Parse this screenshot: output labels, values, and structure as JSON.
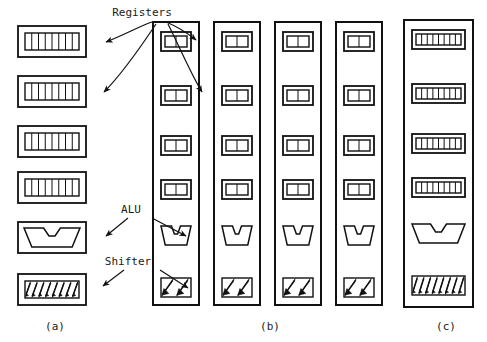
{
  "figure": {
    "title_labels": {
      "registers": "Registers",
      "alu": "ALU",
      "shifter": "Shifter"
    },
    "captions": [
      {
        "key": "a",
        "text": "(a)",
        "x": 55,
        "y": 330
      },
      {
        "key": "b",
        "text": "(b)",
        "x": 270,
        "y": 330
      },
      {
        "key": "c",
        "text": "(c)",
        "x": 446,
        "y": 330
      }
    ],
    "colors": {
      "stroke": "#111111",
      "background": "#ffffff",
      "fill": "#ffffff"
    },
    "label_positions": {
      "registers": {
        "x": 142,
        "y": 16
      },
      "alu": {
        "x": 131,
        "y": 213
      },
      "shifter": {
        "x": 128,
        "y": 265
      }
    },
    "panel_a": {
      "name": "discrete-components",
      "box_width": 68,
      "box_height": 31,
      "x": 18,
      "units": [
        {
          "type": "register",
          "y": 26,
          "cells": 8
        },
        {
          "type": "register",
          "y": 76,
          "cells": 8
        },
        {
          "type": "register",
          "y": 126,
          "cells": 8
        },
        {
          "type": "register",
          "y": 172,
          "cells": 8
        },
        {
          "type": "alu",
          "y": 222
        },
        {
          "type": "shifter",
          "y": 274,
          "arrows": 8
        }
      ]
    },
    "panel_b": {
      "name": "four-two-bit-slices",
      "slice_count": 4,
      "slice_width": 46,
      "slice_top": 22,
      "slice_height": 283,
      "slice_x": [
        153,
        214,
        275,
        336
      ],
      "inner_width": 30,
      "inner_height": 19,
      "units": [
        {
          "type": "register",
          "y": 32,
          "cells": 2
        },
        {
          "type": "register",
          "y": 86,
          "cells": 2
        },
        {
          "type": "register",
          "y": 136,
          "cells": 2
        },
        {
          "type": "register",
          "y": 180,
          "cells": 2
        },
        {
          "type": "alu",
          "y": 226
        },
        {
          "type": "shifter",
          "y": 278,
          "arrows": 2
        }
      ]
    },
    "panel_c": {
      "name": "one-eight-bit-slice",
      "slice_x": 404,
      "slice_top": 20,
      "slice_width": 69,
      "slice_height": 287,
      "inner_width": 53,
      "inner_height": 19,
      "units": [
        {
          "type": "register",
          "y": 30,
          "cells": 8
        },
        {
          "type": "register",
          "y": 84,
          "cells": 8
        },
        {
          "type": "register",
          "y": 134,
          "cells": 8
        },
        {
          "type": "register",
          "y": 178,
          "cells": 8
        },
        {
          "type": "alu",
          "y": 224
        },
        {
          "type": "shifter",
          "y": 276,
          "arrows": 8
        }
      ]
    },
    "arrows": {
      "registers": [
        {
          "name": "registers-to-a-reg1",
          "d": "M 152 22 C 140 26 126 34 106 42",
          "tip": [
            106,
            42
          ]
        },
        {
          "name": "registers-to-a-reg2",
          "d": "M 156 24 C 140 48 122 74 104 92",
          "tip": [
            104,
            92
          ]
        },
        {
          "name": "registers-to-b-reg1",
          "d": "M 166 22 C 176 26 186 32 196 40",
          "tip": [
            196,
            40
          ]
        },
        {
          "name": "registers-to-b-reg2",
          "d": "M 168 24 C 180 48 192 76 202 92",
          "tip": [
            202,
            92
          ]
        }
      ],
      "alu": [
        {
          "name": "alu-to-a-alu",
          "d": "M 128 218 L 106 236",
          "tip": [
            106,
            236
          ]
        },
        {
          "name": "alu-to-b-alu",
          "d": "M 152 218 L 186 236",
          "tip": [
            186,
            236
          ]
        }
      ],
      "shifter": [
        {
          "name": "shifter-to-a-shifter",
          "d": "M 124 270 L 103 286",
          "tip": [
            103,
            286
          ]
        },
        {
          "name": "shifter-to-b-shifter",
          "d": "M 160 270 L 188 288",
          "tip": [
            188,
            288
          ]
        }
      ]
    }
  }
}
